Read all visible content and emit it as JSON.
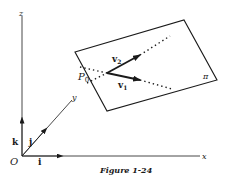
{
  "figure": {
    "caption": "Figure 1-24",
    "axes": {
      "origin_label": "O",
      "x_label": "x",
      "y_label": "y",
      "z_label": "z",
      "unit_vectors": {
        "i": "i",
        "j": "j",
        "k": "k"
      }
    },
    "plane": {
      "label": "π",
      "point_label": "P",
      "point_subscript": "0",
      "vectors": [
        {
          "name": "v1",
          "base": "v",
          "subscript": "1"
        },
        {
          "name": "v2",
          "base": "v",
          "subscript": "2"
        }
      ]
    },
    "colors": {
      "ink": "#1a1a1a",
      "background": "#ffffff"
    }
  }
}
